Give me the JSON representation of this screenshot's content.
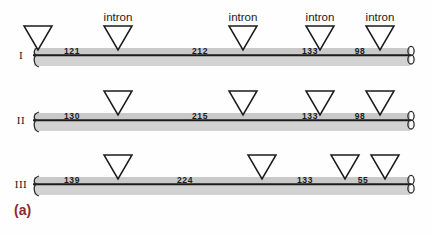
{
  "figure": {
    "caption": "(a)",
    "caption_color": "#8c2733",
    "intron_label": "intron",
    "bar_color": "#c9c9c9",
    "line_color": "#1b1b1b",
    "triangle_fill": "#ffffff",
    "triangle_stroke": "#1b1b1b"
  },
  "chart_data": {
    "type": "diagram",
    "title": "(a)",
    "subtitle": "",
    "xlabel": "",
    "ylabel": "",
    "annotations": [
      "intron",
      "intron",
      "intron",
      "intron"
    ],
    "legend": [],
    "rows": [
      {
        "label": "I",
        "segment_values": [
          121,
          212,
          133,
          98
        ],
        "segment_labels": [
          "121",
          "212",
          "133",
          "98"
        ],
        "segment_x": [
          72,
          200,
          310,
          360
        ],
        "intron_x": [
          38,
          118,
          243,
          320,
          380
        ],
        "intron_labeled": [
          false,
          true,
          true,
          true,
          true
        ],
        "bar_y": 48,
        "label_y": 12
      },
      {
        "label": "II",
        "segment_values": [
          130,
          215,
          133,
          98
        ],
        "segment_labels": [
          "130",
          "215",
          "133",
          "98"
        ],
        "segment_x": [
          72,
          200,
          310,
          360
        ],
        "intron_x": [
          118,
          243,
          320,
          380
        ],
        "intron_labeled": [
          false,
          false,
          false,
          false
        ],
        "bar_y": 113,
        "label_y": 0
      },
      {
        "label": "III",
        "segment_values": [
          139,
          224,
          133,
          55
        ],
        "segment_labels": [
          "139",
          "224",
          "133",
          "55"
        ],
        "segment_x": [
          72,
          185,
          305,
          363
        ],
        "intron_x": [
          118,
          262,
          345,
          385
        ],
        "intron_labeled": [
          false,
          false,
          false,
          false
        ],
        "bar_y": 177,
        "label_y": 0
      }
    ],
    "bar_geometry": {
      "x_start": 34,
      "x_end": 410,
      "band_height": 18,
      "line_offset": 6
    }
  }
}
